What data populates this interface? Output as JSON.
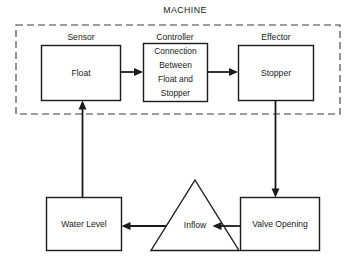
{
  "diagram": {
    "title": "MACHINE",
    "boundary": {
      "label": "MACHINE",
      "style": "dashed"
    },
    "group_captions": [
      {
        "id": "sensor",
        "label": "Sensor"
      },
      {
        "id": "controller",
        "label": "Controller"
      },
      {
        "id": "effector",
        "label": "Effector"
      }
    ],
    "nodes": [
      {
        "id": "float",
        "shape": "rectangle",
        "label": "Float",
        "lines": [
          "Float"
        ]
      },
      {
        "id": "connection",
        "shape": "rectangle",
        "label": "Connection Between Float and Stopper",
        "lines": [
          "Connection",
          "Between",
          "Float and",
          "Stopper"
        ]
      },
      {
        "id": "stopper",
        "shape": "rectangle",
        "label": "Stopper",
        "lines": [
          "Stopper"
        ]
      },
      {
        "id": "water-level",
        "shape": "rectangle",
        "label": "Water Level",
        "lines": [
          "Water Level"
        ]
      },
      {
        "id": "inflow",
        "shape": "triangle",
        "label": "Inflow",
        "lines": [
          "Inflow"
        ]
      },
      {
        "id": "valve-opening",
        "shape": "rectangle",
        "label": "Valve Opening",
        "lines": [
          "Valve Opening"
        ]
      }
    ],
    "edges": [
      {
        "id": "float-to-connection",
        "from": "float",
        "to": "connection",
        "direction": "right"
      },
      {
        "id": "connection-to-stopper",
        "from": "connection",
        "to": "stopper",
        "direction": "right"
      },
      {
        "id": "stopper-to-valve-opening",
        "from": "stopper",
        "to": "valve-opening",
        "direction": "down"
      },
      {
        "id": "valve-opening-to-inflow",
        "from": "valve-opening",
        "to": "inflow",
        "direction": "left"
      },
      {
        "id": "inflow-to-water-level",
        "from": "inflow",
        "to": "water-level",
        "direction": "left"
      },
      {
        "id": "water-level-to-float",
        "from": "water-level",
        "to": "float",
        "direction": "up"
      }
    ],
    "colors": {
      "stroke": "#1a1a1a",
      "boundary_stroke": "#3a3a3a",
      "background": "#ffffff"
    }
  }
}
